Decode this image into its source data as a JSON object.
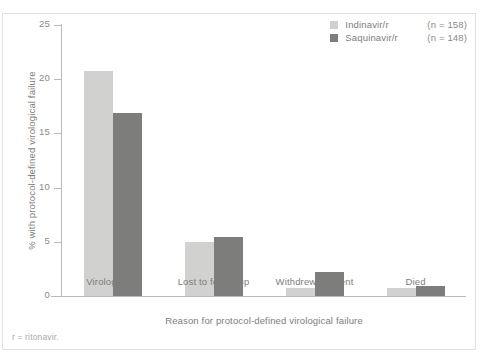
{
  "chart_data": {
    "type": "bar",
    "title": "",
    "subtitle": "",
    "xlabel": "Reason for protocol-defined virological failure",
    "ylabel": "% with protocol-defined virological failure",
    "categories": [
      "Virologically",
      "Lost to follow-up",
      "Withdrew consent",
      "Died"
    ],
    "series": [
      {
        "name": "Indinavir/r",
        "n_label": "(n = 158)",
        "color": "#d1d1cf",
        "values": [
          20.8,
          5.0,
          0.7,
          0.7
        ]
      },
      {
        "name": "Saquinavir/r",
        "n_label": "(n = 148)",
        "color": "#7d7d7c",
        "values": [
          16.9,
          5.4,
          2.2,
          0.9
        ]
      }
    ],
    "ylim": [
      0,
      25
    ],
    "yticks": [
      "0",
      "5",
      "10",
      "15",
      "20",
      "25"
    ],
    "ytick_values": [
      0,
      5,
      10,
      15,
      20,
      25
    ],
    "grid": false,
    "legend_position": "top-right",
    "footnote": "r = ritonavir."
  },
  "legend": {
    "rows": [
      {
        "name": "Indinavir/r",
        "n": "(n = 158)"
      },
      {
        "name": "Saquinavir/r",
        "n": "(n = 148)"
      }
    ]
  },
  "axes": {
    "y_title": "% with protocol-defined virological failure",
    "x_title": "Reason for protocol-defined virological failure"
  },
  "footnote": "r = ritonavir."
}
